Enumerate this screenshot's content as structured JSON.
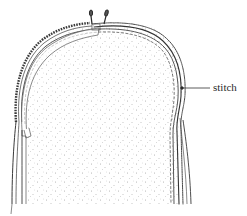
{
  "diagram": {
    "labels": [
      {
        "id": "stitch",
        "text": "stitch",
        "x": 213,
        "y": 82,
        "leader": {
          "from": [
            183,
            88
          ],
          "to": [
            210,
            88
          ]
        }
      }
    ],
    "colors": {
      "line": "#3a3a3a",
      "stipple": "#9a9a9a",
      "background": "#ffffff"
    }
  }
}
